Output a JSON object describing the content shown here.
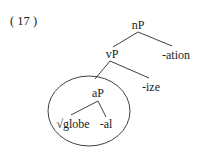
{
  "example": {
    "number_label": "( 17 )"
  },
  "tree": {
    "root": {
      "label": "nP",
      "children": [
        "vP",
        "-ation"
      ]
    },
    "nodes": {
      "nP": "nP",
      "vP": "vP",
      "ation": "-ation",
      "ize": "-ize",
      "aP": "aP",
      "globe": "√globe",
      "al": "-al"
    },
    "structure": [
      {
        "parent": "nP",
        "children": [
          "vP",
          "-ation"
        ]
      },
      {
        "parent": "vP",
        "children": [
          "aP",
          "-ize"
        ]
      },
      {
        "parent": "aP",
        "children": [
          "√globe",
          "-al"
        ]
      }
    ],
    "highlight": {
      "shape": "ellipse",
      "encloses": "aP"
    }
  },
  "colors": {
    "ink": "#1a1a1a",
    "background": "#ffffff"
  }
}
